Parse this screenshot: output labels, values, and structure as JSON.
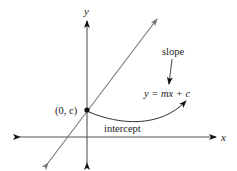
{
  "diagram": {
    "axes": {
      "x_label": "x",
      "y_label": "y"
    },
    "point_label": "(0, c)",
    "slope_label": "slope",
    "equation": "y = mx + c",
    "intercept_label": "intercept",
    "colors": {
      "axis": "#555555",
      "line": "#777777",
      "curve": "#333333",
      "point": "#111111",
      "text": "#222222"
    }
  }
}
